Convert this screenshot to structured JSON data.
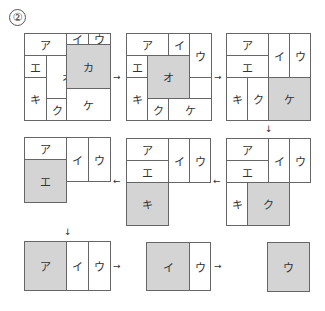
{
  "problem_number": "②",
  "shade_color": "#d4d4d4",
  "stages": [
    {
      "id": "stage-1",
      "cells": [
        {
          "label": "ア",
          "x": 24,
          "y": 33,
          "w": 42,
          "h": 22,
          "shaded": false
        },
        {
          "label": "イ",
          "x": 66,
          "y": 33,
          "w": 22,
          "h": 11,
          "shaded": false
        },
        {
          "label": "ウ",
          "x": 88,
          "y": 33,
          "w": 22,
          "h": 11,
          "shaded": false
        },
        {
          "label": "エ",
          "x": 24,
          "y": 55,
          "w": 22,
          "h": 22,
          "shaded": false
        },
        {
          "label": "オ",
          "x": 46,
          "y": 55,
          "w": 42,
          "h": 43,
          "shaded": false
        },
        {
          "label": "カ",
          "x": 66,
          "y": 44,
          "w": 44,
          "h": 44,
          "shaded": true
        },
        {
          "label": "キ",
          "x": 24,
          "y": 77,
          "w": 22,
          "h": 43,
          "shaded": false
        },
        {
          "label": "ク",
          "x": 46,
          "y": 98,
          "w": 21,
          "h": 22,
          "shaded": false
        },
        {
          "label": "ケ",
          "x": 66,
          "y": 88,
          "w": 44,
          "h": 32,
          "shaded": false
        }
      ]
    },
    {
      "id": "stage-2",
      "cells": [
        {
          "label": "ア",
          "x": 126,
          "y": 33,
          "w": 42,
          "h": 22,
          "shaded": false
        },
        {
          "label": "イ",
          "x": 168,
          "y": 33,
          "w": 21,
          "h": 22,
          "shaded": false
        },
        {
          "label": "ウ",
          "x": 189,
          "y": 33,
          "w": 22,
          "h": 44,
          "shaded": false
        },
        {
          "label": "エ",
          "x": 126,
          "y": 55,
          "w": 21,
          "h": 22,
          "shaded": false
        },
        {
          "label": "オ",
          "x": 147,
          "y": 55,
          "w": 42,
          "h": 43,
          "shaded": true
        },
        {
          "label": "キ",
          "x": 126,
          "y": 77,
          "w": 21,
          "h": 43,
          "shaded": false
        },
        {
          "label": "ク",
          "x": 147,
          "y": 98,
          "w": 21,
          "h": 22,
          "shaded": false
        },
        {
          "label": "ケ",
          "x": 168,
          "y": 98,
          "w": 43,
          "h": 22,
          "shaded": false
        },
        {
          "label": "",
          "x": 189,
          "y": 77,
          "w": 22,
          "h": 21,
          "shaded": false
        }
      ]
    },
    {
      "id": "stage-3",
      "cells": [
        {
          "label": "ア",
          "x": 226,
          "y": 33,
          "w": 42,
          "h": 22,
          "shaded": false
        },
        {
          "label": "エ",
          "x": 226,
          "y": 55,
          "w": 42,
          "h": 22,
          "shaded": false
        },
        {
          "label": "イ",
          "x": 268,
          "y": 33,
          "w": 21,
          "h": 44,
          "shaded": false
        },
        {
          "label": "ウ",
          "x": 289,
          "y": 33,
          "w": 21,
          "h": 44,
          "shaded": false
        },
        {
          "label": "キ",
          "x": 226,
          "y": 77,
          "w": 21,
          "h": 43,
          "shaded": false
        },
        {
          "label": "ク",
          "x": 247,
          "y": 77,
          "w": 21,
          "h": 43,
          "shaded": false
        },
        {
          "label": "ケ",
          "x": 268,
          "y": 77,
          "w": 42,
          "h": 43,
          "shaded": true
        }
      ]
    },
    {
      "id": "stage-4",
      "cells": [
        {
          "label": "ア",
          "x": 226,
          "y": 138,
          "w": 42,
          "h": 22,
          "shaded": false
        },
        {
          "label": "エ",
          "x": 226,
          "y": 160,
          "w": 42,
          "h": 22,
          "shaded": false
        },
        {
          "label": "イ",
          "x": 268,
          "y": 138,
          "w": 21,
          "h": 44,
          "shaded": false
        },
        {
          "label": "ウ",
          "x": 289,
          "y": 138,
          "w": 21,
          "h": 44,
          "shaded": false
        },
        {
          "label": "キ",
          "x": 226,
          "y": 182,
          "w": 21,
          "h": 43,
          "shaded": false
        },
        {
          "label": "ク",
          "x": 247,
          "y": 182,
          "w": 42,
          "h": 43,
          "shaded": true
        }
      ]
    },
    {
      "id": "stage-5",
      "cells": [
        {
          "label": "ア",
          "x": 126,
          "y": 138,
          "w": 42,
          "h": 22,
          "shaded": false
        },
        {
          "label": "エ",
          "x": 126,
          "y": 160,
          "w": 42,
          "h": 22,
          "shaded": false
        },
        {
          "label": "イ",
          "x": 168,
          "y": 138,
          "w": 21,
          "h": 44,
          "shaded": false
        },
        {
          "label": "ウ",
          "x": 189,
          "y": 138,
          "w": 21,
          "h": 44,
          "shaded": false
        },
        {
          "label": "キ",
          "x": 126,
          "y": 182,
          "w": 42,
          "h": 43,
          "shaded": true
        }
      ]
    },
    {
      "id": "stage-6",
      "cells": [
        {
          "label": "ア",
          "x": 24,
          "y": 137,
          "w": 42,
          "h": 22,
          "shaded": false
        },
        {
          "label": "エ",
          "x": 24,
          "y": 159,
          "w": 42,
          "h": 43,
          "shaded": true
        },
        {
          "label": "イ",
          "x": 66,
          "y": 137,
          "w": 22,
          "h": 44,
          "shaded": false
        },
        {
          "label": "ウ",
          "x": 88,
          "y": 137,
          "w": 22,
          "h": 44,
          "shaded": false
        }
      ]
    },
    {
      "id": "stage-7",
      "cells": [
        {
          "label": "ア",
          "x": 24,
          "y": 241,
          "w": 42,
          "h": 49,
          "shaded": true
        },
        {
          "label": "イ",
          "x": 66,
          "y": 241,
          "w": 22,
          "h": 49,
          "shaded": false
        },
        {
          "label": "ウ",
          "x": 88,
          "y": 241,
          "w": 22,
          "h": 49,
          "shaded": false
        }
      ]
    },
    {
      "id": "stage-8",
      "cells": [
        {
          "label": "イ",
          "x": 146,
          "y": 242,
          "w": 43,
          "h": 48,
          "shaded": true
        },
        {
          "label": "ウ",
          "x": 189,
          "y": 242,
          "w": 21,
          "h": 48,
          "shaded": false
        }
      ]
    },
    {
      "id": "stage-9",
      "cells": [
        {
          "label": "ウ",
          "x": 267,
          "y": 242,
          "w": 42,
          "h": 49,
          "shaded": true
        }
      ]
    }
  ],
  "arrows": [
    {
      "glyph": "→",
      "x": 113,
      "y": 72
    },
    {
      "glyph": "→",
      "x": 214,
      "y": 72
    },
    {
      "glyph": "↓",
      "x": 265,
      "y": 124
    },
    {
      "glyph": "←",
      "x": 213,
      "y": 176
    },
    {
      "glyph": "←",
      "x": 113,
      "y": 176
    },
    {
      "glyph": "↓",
      "x": 64,
      "y": 227
    },
    {
      "glyph": "→",
      "x": 113,
      "y": 261
    },
    {
      "glyph": "→",
      "x": 214,
      "y": 261
    }
  ]
}
